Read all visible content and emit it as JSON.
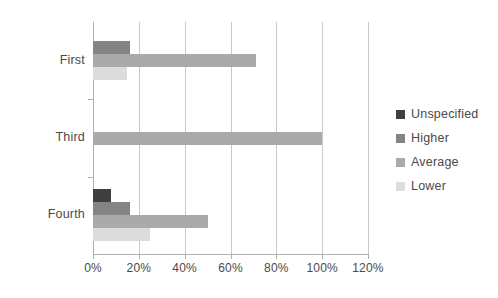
{
  "chart_data": {
    "type": "bar",
    "orientation": "horizontal",
    "title": "",
    "xlabel": "",
    "ylabel": "",
    "categories": [
      "First",
      "Third",
      "Fourth"
    ],
    "xticks": [
      "0%",
      "20%",
      "40%",
      "60%",
      "80%",
      "100%",
      "120%"
    ],
    "xtick_values": [
      0,
      20,
      40,
      60,
      80,
      100,
      120
    ],
    "xlim": [
      0,
      120
    ],
    "grid": "vertical",
    "legend_position": "right",
    "series": [
      {
        "name": "Unspecified",
        "color": "#3f3f3f",
        "values": [
          null,
          null,
          8
        ]
      },
      {
        "name": "Higher",
        "color": "#848484",
        "values": [
          16,
          null,
          16
        ]
      },
      {
        "name": "Average",
        "color": "#aaaaaa",
        "values": [
          71,
          100,
          50
        ]
      },
      {
        "name": "Lower",
        "color": "#dcdcdc",
        "values": [
          15,
          null,
          25
        ]
      }
    ]
  },
  "legend": {
    "items": [
      {
        "label": "Unspecified",
        "color": "#3f3f3f"
      },
      {
        "label": "Higher",
        "color": "#848484"
      },
      {
        "label": "Average",
        "color": "#aaaaaa"
      },
      {
        "label": "Lower",
        "color": "#dcdcdc"
      }
    ]
  },
  "axes": {
    "category_labels": [
      "First",
      "Third",
      "Fourth"
    ],
    "value_tick_labels": [
      "0%",
      "20%",
      "40%",
      "60%",
      "80%",
      "100%",
      "120%"
    ]
  }
}
